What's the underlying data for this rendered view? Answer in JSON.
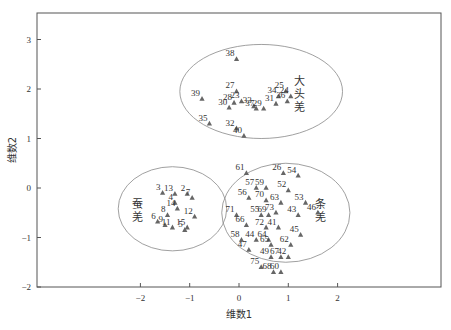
{
  "chart_data": {
    "type": "scatter",
    "title": "",
    "xlabel": "维数1",
    "ylabel": "维数2",
    "xlim": [
      -4.1,
      4.1
    ],
    "ylim": [
      -2,
      3.55
    ],
    "x_ticks": [
      -2,
      -1,
      0,
      1,
      2
    ],
    "y_ticks": [
      -2,
      -1,
      0,
      1,
      2,
      3
    ],
    "grid": false,
    "legend": null,
    "marker": "triangle",
    "marker_color": "#666666",
    "groups": [
      {
        "name": "大头羌",
        "label_chars": [
          "大",
          "头",
          "羌"
        ],
        "ellipse": {
          "cx": 0.45,
          "cy": 1.95,
          "rx": 1.65,
          "ry": 0.95
        },
        "label_pos": [
          1.22,
          1.9
        ]
      },
      {
        "name": "蚕羌",
        "label_chars": [
          "蚕",
          "羌"
        ],
        "ellipse": {
          "cx": -1.35,
          "cy": -0.42,
          "rx": 1.1,
          "ry": 0.85
        },
        "label_pos": [
          -2.05,
          -0.45
        ]
      },
      {
        "name": "条羌",
        "label_chars": [
          "条",
          "羌"
        ],
        "ellipse": {
          "cx": 0.95,
          "cy": -0.5,
          "rx": 1.3,
          "ry": 1.0
        },
        "label_pos": [
          1.65,
          -0.45
        ]
      }
    ],
    "points": [
      {
        "id": "38",
        "x": -0.05,
        "y": 2.6
      },
      {
        "id": "27",
        "x": -0.05,
        "y": 1.95
      },
      {
        "id": "39",
        "x": -0.75,
        "y": 1.8
      },
      {
        "id": "28",
        "x": -0.1,
        "y": 1.72
      },
      {
        "id": "23",
        "x": 0.05,
        "y": 1.75
      },
      {
        "id": "33",
        "x": 0.3,
        "y": 1.65
      },
      {
        "id": "30",
        "x": -0.2,
        "y": 1.62
      },
      {
        "id": "37",
        "x": 0.35,
        "y": 1.6
      },
      {
        "id": "29",
        "x": 0.5,
        "y": 1.6
      },
      {
        "id": "34",
        "x": 0.8,
        "y": 1.85
      },
      {
        "id": "31",
        "x": 0.75,
        "y": 1.7
      },
      {
        "id": "25",
        "x": 0.95,
        "y": 1.95
      },
      {
        "id": "24",
        "x": 1.05,
        "y": 1.85
      },
      {
        "id": "36",
        "x": 0.98,
        "y": 1.75
      },
      {
        "id": "35",
        "x": -0.6,
        "y": 1.3
      },
      {
        "id": "32",
        "x": -0.05,
        "y": 1.2
      },
      {
        "id": "40",
        "x": 0.1,
        "y": 1.05
      },
      {
        "id": "3",
        "x": -1.55,
        "y": -0.1
      },
      {
        "id": "13",
        "x": -1.3,
        "y": -0.12
      },
      {
        "id": "2",
        "x": -1.05,
        "y": -0.12
      },
      {
        "id": "7",
        "x": -0.95,
        "y": -0.2
      },
      {
        "id": "4",
        "x": -1.3,
        "y": -0.3
      },
      {
        "id": "14",
        "x": -1.25,
        "y": -0.42
      },
      {
        "id": "8",
        "x": -1.45,
        "y": -0.55
      },
      {
        "id": "6",
        "x": -1.65,
        "y": -0.68
      },
      {
        "id": "9",
        "x": -1.5,
        "y": -0.75
      },
      {
        "id": "12",
        "x": -0.9,
        "y": -0.58
      },
      {
        "id": "11",
        "x": -1.35,
        "y": -0.8
      },
      {
        "id": "5",
        "x": -1.1,
        "y": -0.85
      },
      {
        "id": "15",
        "x": -1.05,
        "y": -0.8
      },
      {
        "id": "61",
        "x": 0.15,
        "y": 0.3
      },
      {
        "id": "26",
        "x": 0.9,
        "y": 0.3
      },
      {
        "id": "54",
        "x": 1.2,
        "y": 0.25
      },
      {
        "id": "57",
        "x": 0.35,
        "y": 0.0
      },
      {
        "id": "59",
        "x": 0.55,
        "y": 0.0
      },
      {
        "id": "52",
        "x": 1.0,
        "y": -0.05
      },
      {
        "id": "56",
        "x": 0.2,
        "y": -0.2
      },
      {
        "id": "70",
        "x": 0.55,
        "y": -0.25
      },
      {
        "id": "63",
        "x": 0.85,
        "y": -0.3
      },
      {
        "id": "53",
        "x": 1.35,
        "y": -0.3
      },
      {
        "id": "71",
        "x": -0.05,
        "y": -0.55
      },
      {
        "id": "55",
        "x": 0.45,
        "y": -0.55
      },
      {
        "id": "69",
        "x": 0.6,
        "y": -0.55
      },
      {
        "id": "73",
        "x": 0.75,
        "y": -0.5
      },
      {
        "id": "43",
        "x": 1.2,
        "y": -0.55
      },
      {
        "id": "46",
        "x": 1.6,
        "y": -0.5
      },
      {
        "id": "66",
        "x": 0.15,
        "y": -0.75
      },
      {
        "id": "72",
        "x": 0.55,
        "y": -0.8
      },
      {
        "id": "41",
        "x": 0.8,
        "y": -0.8
      },
      {
        "id": "45",
        "x": 1.25,
        "y": -0.95
      },
      {
        "id": "58",
        "x": 0.05,
        "y": -1.05
      },
      {
        "id": "44",
        "x": 0.35,
        "y": -1.05
      },
      {
        "id": "64",
        "x": 0.6,
        "y": -1.05
      },
      {
        "id": "65",
        "x": 0.65,
        "y": -1.15
      },
      {
        "id": "62",
        "x": 1.05,
        "y": -1.15
      },
      {
        "id": "47",
        "x": 0.2,
        "y": -1.25
      },
      {
        "id": "49",
        "x": 0.65,
        "y": -1.4
      },
      {
        "id": "67",
        "x": 0.85,
        "y": -1.4
      },
      {
        "id": "42",
        "x": 1.0,
        "y": -1.4
      },
      {
        "id": "75",
        "x": 0.45,
        "y": -1.6
      },
      {
        "id": "68",
        "x": 0.7,
        "y": -1.7
      },
      {
        "id": "60",
        "x": 0.85,
        "y": -1.7
      }
    ]
  }
}
